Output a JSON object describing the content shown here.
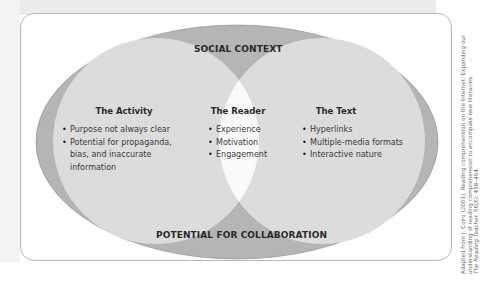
{
  "diagram": {
    "outer_top_label": "SOCIAL CONTEXT",
    "outer_bottom_label": "POTENTIAL FOR COLLABORATION",
    "circles": [
      {
        "title": "The Activity",
        "items": [
          "Purpose not always clear",
          "Potential for propaganda, bias, and inaccurate information"
        ]
      },
      {
        "title": "The Reader",
        "items": [
          "Experience",
          "Motivation",
          "Engagement"
        ]
      },
      {
        "title": "The Text",
        "items": [
          "Hyperlinks",
          "Multiple-media formats",
          "Interactive nature"
        ]
      }
    ],
    "colors": {
      "outer_ring": "#b5b5b5",
      "inner_circles": "#dcdcdc",
      "center_overlap": "#fafafa",
      "text": "#2a2a2a"
    }
  },
  "citation": {
    "line1": "Adapted from J. Coiro (2003). Reading comprehension on the Internet: Expanding our",
    "line2": "understanding of reading comprehension to encompass new literacies.",
    "line3_journal": "The Reading Teacher,",
    "line3_rest": " 56(6): 458–464."
  }
}
